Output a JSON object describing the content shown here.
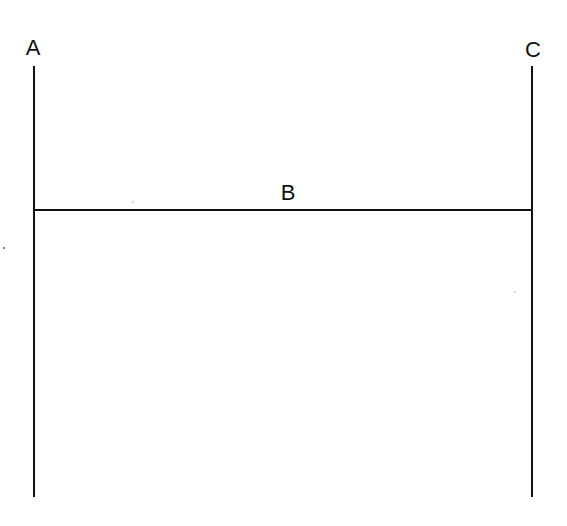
{
  "diagram": {
    "labels": {
      "a": "A",
      "b": "B",
      "c": "C"
    },
    "line_color": "#111111",
    "background": "#ffffff",
    "elements": [
      {
        "id": "A",
        "type": "vertical-line",
        "x": 34,
        "y1": 66,
        "y2": 497
      },
      {
        "id": "B",
        "type": "horizontal-line",
        "y": 210,
        "x1": 34,
        "x2": 532
      },
      {
        "id": "C",
        "type": "vertical-line",
        "x": 532,
        "y1": 66,
        "y2": 497
      }
    ]
  }
}
